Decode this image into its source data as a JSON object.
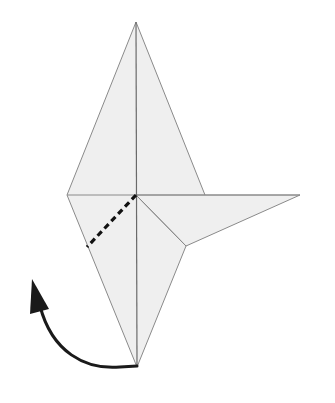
{
  "diagram": {
    "type": "origami-fold-step",
    "colors": {
      "paper_fill": "#efefef",
      "crease_line": "#8a8a8a",
      "center_line": "#6a6a6a",
      "valley_fold_dash": "#111111",
      "arrow": "#1a1a1a",
      "background": "#ffffff"
    },
    "vertices": {
      "top_tip": [
        136,
        22
      ],
      "left_point": [
        67,
        195
      ],
      "center": [
        136,
        195
      ],
      "right_point": [
        205,
        195
      ],
      "wing_tip": [
        300,
        195
      ],
      "inner_vertex": [
        186,
        246
      ],
      "bottom_tip": [
        137,
        367
      ],
      "dash_end": [
        87,
        247
      ]
    },
    "annotations": {
      "valley_fold": "dashed line from center to lower-left edge",
      "arrow": "curved arrow from bottom tip folding up to the left"
    }
  }
}
